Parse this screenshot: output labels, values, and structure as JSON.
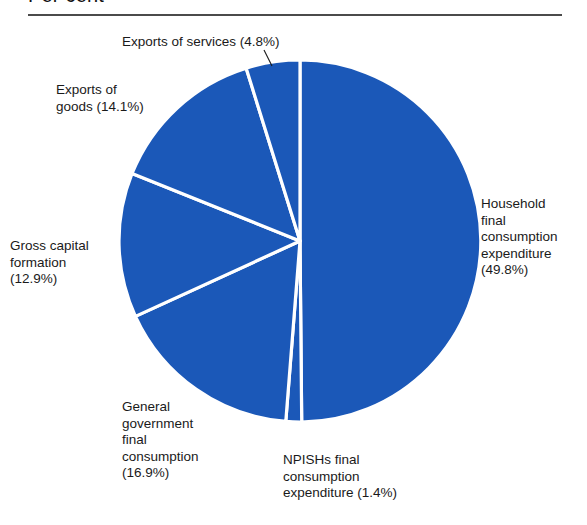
{
  "chart_data": {
    "type": "pie",
    "title": "Per cent",
    "subtitle": "",
    "xlabel": "",
    "ylabel": "",
    "legend_position": "none",
    "grid": false,
    "units": "per cent",
    "start_angle_deg": 0,
    "direction": "clockwise",
    "categories": [
      "Household final consumption expenditure",
      "NPISHs final consumption expenditure",
      "General government final consumption",
      "Gross capital formation",
      "Exports of goods",
      "Exports of services"
    ],
    "values": [
      49.8,
      1.4,
      16.9,
      12.9,
      14.1,
      4.8
    ],
    "colors": [
      "#1b58b8",
      "#1b58b8",
      "#1b58b8",
      "#1b58b8",
      "#1b58b8",
      "#1b58b8"
    ],
    "slice_separator_color": "#ffffff",
    "slices": [
      {
        "name": "Household final consumption expenditure",
        "value": 49.8,
        "label_text": "Household\nfinal\nconsumption\nexpenditure\n(49.8%)",
        "label_position": "right"
      },
      {
        "name": "NPISHs final consumption expenditure",
        "value": 1.4,
        "label_text": "NPISHs final\nconsumption\nexpenditure (1.4%)",
        "label_position": "bottom"
      },
      {
        "name": "General government final consumption",
        "value": 16.9,
        "label_text": "General\ngovernment\nfinal\nconsumption\n(16.9%)",
        "label_position": "bottom-left"
      },
      {
        "name": "Gross capital formation",
        "value": 12.9,
        "label_text": "Gross capital\nformation\n(12.9%)",
        "label_position": "left"
      },
      {
        "name": "Exports of goods",
        "value": 14.1,
        "label_text": "Exports of\ngoods (14.1%)",
        "label_position": "top-left"
      },
      {
        "name": "Exports of services",
        "value": 4.8,
        "label_text": "Exports of services (4.8%)",
        "label_position": "top"
      }
    ]
  },
  "figure": {
    "title": "Per cent",
    "accent_color": "#1b58b8",
    "rule_color": "#4b4b4b",
    "background": "#ffffff"
  },
  "labels": {
    "household": "Household\nfinal\nconsumption\nexpenditure\n(49.8%)",
    "npishs": "NPISHs final\nconsumption\nexpenditure (1.4%)",
    "general_government": "General\ngovernment\nfinal\nconsumption\n(16.9%)",
    "gross_capital": "Gross capital\nformation\n(12.9%)",
    "exports_goods": "Exports of\ngoods (14.1%)",
    "exports_services": "Exports of services (4.8%)"
  }
}
